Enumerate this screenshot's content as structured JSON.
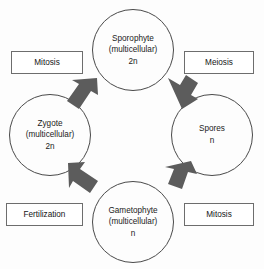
{
  "diagram": {
    "top_caption_fragment": "",
    "colors": {
      "circle_stroke": "#4a4a4a",
      "box_stroke": "#6d6d6d",
      "arrow_fill": "#5c5c5c",
      "text": "#1b1b1b",
      "background": "#fdfdfd"
    },
    "nodes": [
      {
        "id": "sporophyte",
        "name": "Sporophyte",
        "qualifier": "(multicellular)",
        "ploidy": "2n",
        "position": "top"
      },
      {
        "id": "spores",
        "name": "Spores",
        "qualifier": "",
        "ploidy": "n",
        "position": "right"
      },
      {
        "id": "gametophyte",
        "name": "Gametophyte",
        "qualifier": "(multicellular)",
        "ploidy": "n",
        "position": "bottom"
      },
      {
        "id": "zygote",
        "name": "Zygote",
        "qualifier": "(multicellular)",
        "ploidy": "2n",
        "position": "left"
      }
    ],
    "process_labels": [
      {
        "id": "mitosis-top",
        "label": "Mitosis",
        "position": "top-left"
      },
      {
        "id": "meiosis",
        "label": "Meiosis",
        "position": "top-right"
      },
      {
        "id": "fertilization",
        "label": "Fertilization",
        "position": "bottom-left"
      },
      {
        "id": "mitosis-bottom",
        "label": "Mitosis",
        "position": "bottom-right"
      }
    ],
    "arrows": [
      {
        "id": "zygote-to-sporophyte",
        "from": "zygote",
        "to": "sporophyte",
        "direction": "up-right",
        "process": "Mitosis"
      },
      {
        "id": "sporophyte-to-spores",
        "from": "sporophyte",
        "to": "spores",
        "direction": "down-right",
        "process": "Meiosis"
      },
      {
        "id": "spores-to-gametophyte",
        "from": "spores",
        "to": "gametophyte",
        "direction": "down-left",
        "process": "Mitosis"
      },
      {
        "id": "gametophyte-to-zygote",
        "from": "gametophyte",
        "to": "zygote",
        "direction": "up-left",
        "process": "Fertilization"
      }
    ]
  }
}
